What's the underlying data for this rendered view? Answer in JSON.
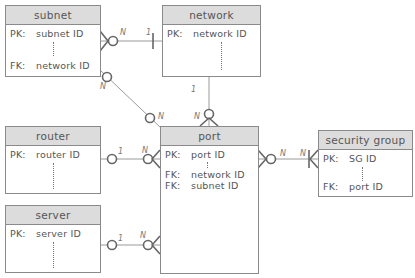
{
  "entities": {
    "subnet": {
      "title": "subnet",
      "pk_label": "PK:",
      "pk": "subnet ID",
      "fk_label": "FK:",
      "fk": "network ID"
    },
    "network": {
      "title": "network",
      "pk_label": "PK:",
      "pk": "network ID"
    },
    "router": {
      "title": "router",
      "pk_label": "PK:",
      "pk": "router ID"
    },
    "server": {
      "title": "server",
      "pk_label": "PK:",
      "pk": "server ID"
    },
    "port": {
      "title": "port",
      "pk_label": "PK:",
      "pk": "port ID",
      "fk_label": "FK:",
      "fk1": "network ID",
      "fk2": "subnet ID"
    },
    "security_group": {
      "title": "security group",
      "pk_label": "PK:",
      "pk": "SG ID",
      "fk_label": "FK:",
      "fk": "port ID"
    }
  },
  "relationships": [
    {
      "from": "subnet",
      "to": "network",
      "from_card": "N",
      "to_card": "1"
    },
    {
      "from": "subnet",
      "to": "port",
      "from_card": "N",
      "to_card": "N"
    },
    {
      "from": "network",
      "to": "port",
      "from_card": "1",
      "to_card": "N"
    },
    {
      "from": "router",
      "to": "port",
      "from_card": "1",
      "to_card": "N"
    },
    {
      "from": "server",
      "to": "port",
      "from_card": "1",
      "to_card": "N"
    },
    {
      "from": "port",
      "to": "security_group",
      "from_card": "N",
      "to_card": "N"
    }
  ],
  "labels": {
    "subnet_network_n": "N",
    "subnet_network_1": "1",
    "subnet_port_n1": "N",
    "subnet_port_n2": "N",
    "network_port_1": "1",
    "network_port_n": "N",
    "router_port_1": "1",
    "router_port_n": "N",
    "server_port_1": "1",
    "server_port_n": "N",
    "port_sg_n1": "N",
    "port_sg_n2": "N"
  },
  "colors": {
    "header_bg": "#dcdcdc",
    "border": "#8a8a8a",
    "line": "#999999"
  }
}
